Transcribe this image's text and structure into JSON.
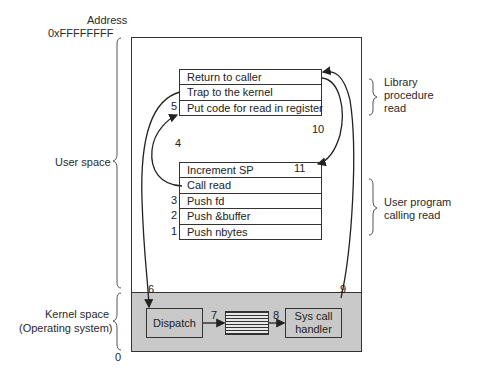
{
  "address": {
    "label": "Address",
    "top_value": "0xFFFFFFFF",
    "bottom_value": "0"
  },
  "regions": {
    "user_space": "User space",
    "kernel_space_line1": "Kernel space",
    "kernel_space_line2": "(Operating system)"
  },
  "annotations": {
    "library_line1": "Library",
    "library_line2": "procedure",
    "library_line3": "read",
    "user_prog_line1": "User program",
    "user_prog_line2": "calling read"
  },
  "library_stack": [
    {
      "label": "Return to caller",
      "step": ""
    },
    {
      "label": "Trap to the kernel",
      "step": ""
    },
    {
      "label": "Put code for read in register",
      "step": "5"
    }
  ],
  "user_stack": [
    {
      "label": "Increment SP",
      "step": "",
      "note": "11"
    },
    {
      "label": "Call read",
      "step": ""
    },
    {
      "label": "Push fd",
      "step": "3"
    },
    {
      "label": "Push &buffer",
      "step": "2"
    },
    {
      "label": "Push nbytes",
      "step": "1"
    }
  ],
  "kernel": {
    "dispatch": "Dispatch",
    "handler_line1": "Sys call",
    "handler_line2": "handler"
  },
  "steps": {
    "s4": "4",
    "s6": "6",
    "s7": "7",
    "s8": "8",
    "s9": "9",
    "s10": "10"
  },
  "colors": {
    "kernel_fill": "#c9c9c9",
    "line": "#333333"
  }
}
